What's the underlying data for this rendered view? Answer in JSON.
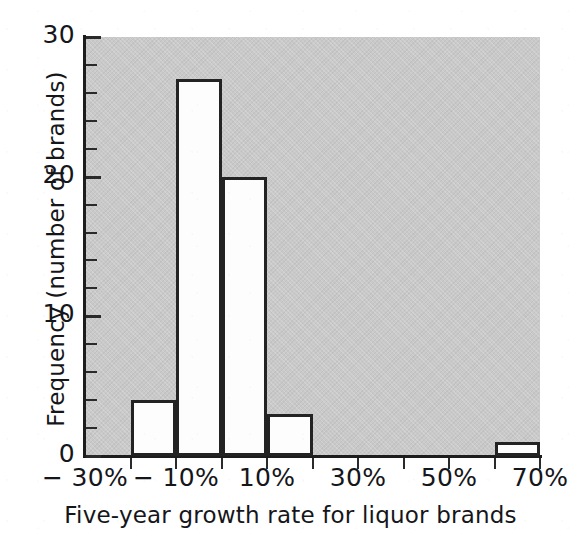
{
  "chart_data": {
    "type": "bar",
    "title": "",
    "subtitle": "",
    "xlabel": "Five-year growth rate for liquor brands",
    "ylabel": "Frequency (number of brands)",
    "xlim": [
      -30,
      70
    ],
    "ylim": [
      0,
      30
    ],
    "bin_width": 10,
    "grid": false,
    "legend": null,
    "annotations": [],
    "x_tick_labels": [
      "− 30%",
      "− 10%",
      "10%",
      "30%",
      "50%",
      "70%"
    ],
    "x_tick_values": [
      -30,
      -10,
      10,
      30,
      50,
      70
    ],
    "x_minor_tick_values": [
      -20,
      0,
      20,
      40,
      60
    ],
    "y_tick_labels": [
      "0",
      "10",
      "20",
      "30"
    ],
    "y_tick_values": [
      0,
      10,
      20,
      30
    ],
    "y_minor_tick_values": [
      2,
      4,
      6,
      8,
      12,
      14,
      16,
      18,
      22,
      24,
      26,
      28
    ],
    "categories": [
      "-30% to -20%",
      "-20% to -10%",
      "-10% to 0%",
      "0% to 10%",
      "10% to 20%",
      "20% to 30%",
      "30% to 40%",
      "40% to 50%",
      "50% to 60%",
      "60% to 70%"
    ],
    "bin_starts": [
      -30,
      -20,
      -10,
      0,
      10,
      20,
      30,
      40,
      50,
      60
    ],
    "values": [
      0,
      4,
      27,
      20,
      3,
      0,
      0,
      0,
      0,
      1
    ],
    "colors": {
      "plot_background": "#c9c9c9",
      "page_background": "#ffffff",
      "bar_fill": "#fdfdfd",
      "bar_outline": "#232323",
      "axis": "#1d1d1d",
      "text": "#15161a"
    }
  },
  "figure": {
    "name": "liquor-brand-growth-histogram",
    "x_axis_title": "Five-year growth rate for liquor brands",
    "y_axis_title": "Frequency (number of brands)"
  }
}
